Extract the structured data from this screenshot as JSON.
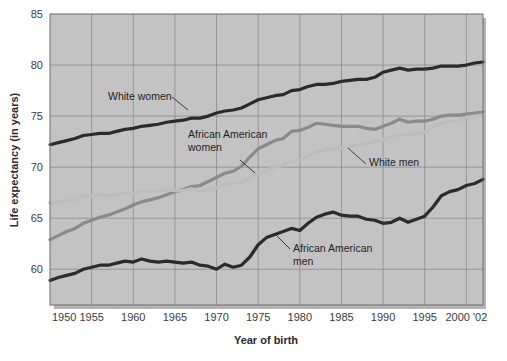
{
  "chart_data": {
    "type": "line",
    "title": "",
    "xlabel": "Year of birth",
    "ylabel": "Life expectancy (in years)",
    "xlim": [
      1950,
      2002
    ],
    "ylim": [
      56.5,
      85
    ],
    "grid": true,
    "legend_position": "inline-annotations",
    "x_ticks": [
      1950,
      1955,
      1960,
      1965,
      1970,
      1975,
      1980,
      1985,
      1990,
      1995,
      2000
    ],
    "x_tick_labels": [
      "1950",
      "1955",
      "1960",
      "1965",
      "1970",
      "1975",
      "1980",
      "1985",
      "1990",
      "1995",
      "2000 '02"
    ],
    "y_ticks": [
      60,
      65,
      70,
      75,
      80,
      85
    ],
    "y_tick_labels": [
      "60",
      "65",
      "70",
      "75",
      "80",
      "85"
    ],
    "x": [
      1950,
      1951,
      1952,
      1953,
      1954,
      1955,
      1956,
      1957,
      1958,
      1959,
      1960,
      1961,
      1962,
      1963,
      1964,
      1965,
      1966,
      1967,
      1968,
      1969,
      1970,
      1971,
      1972,
      1973,
      1974,
      1975,
      1976,
      1977,
      1978,
      1979,
      1980,
      1981,
      1982,
      1983,
      1984,
      1985,
      1986,
      1987,
      1988,
      1989,
      1990,
      1991,
      1992,
      1993,
      1994,
      1995,
      1996,
      1997,
      1998,
      1999,
      2000,
      2001,
      2002
    ],
    "series": [
      {
        "name": "White women",
        "color": "#2b2b2b",
        "width": 3.2,
        "values": [
          72.2,
          72.4,
          72.6,
          72.8,
          73.1,
          73.2,
          73.3,
          73.3,
          73.5,
          73.7,
          73.8,
          74.0,
          74.1,
          74.2,
          74.4,
          74.5,
          74.6,
          74.8,
          74.8,
          75.0,
          75.3,
          75.5,
          75.6,
          75.8,
          76.2,
          76.6,
          76.8,
          77.0,
          77.1,
          77.5,
          77.6,
          77.9,
          78.1,
          78.1,
          78.2,
          78.4,
          78.5,
          78.6,
          78.6,
          78.8,
          79.3,
          79.5,
          79.7,
          79.5,
          79.6,
          79.6,
          79.7,
          79.9,
          79.9,
          79.9,
          80.0,
          80.2,
          80.3
        ]
      },
      {
        "name": "African American women",
        "color": "#8a8a8a",
        "width": 3.2,
        "values": [
          62.9,
          63.3,
          63.7,
          64.0,
          64.5,
          64.8,
          65.1,
          65.3,
          65.6,
          65.9,
          66.3,
          66.6,
          66.8,
          67.0,
          67.3,
          67.6,
          67.8,
          68.1,
          68.2,
          68.6,
          69.0,
          69.4,
          69.6,
          70.1,
          71.0,
          71.8,
          72.2,
          72.6,
          72.8,
          73.5,
          73.6,
          73.9,
          74.3,
          74.2,
          74.1,
          74.0,
          74.0,
          74.0,
          73.8,
          73.7,
          74.0,
          74.3,
          74.7,
          74.4,
          74.5,
          74.5,
          74.7,
          75.0,
          75.1,
          75.1,
          75.2,
          75.3,
          75.4
        ]
      },
      {
        "name": "White men",
        "color": "#bdbdbd",
        "width": 3.2,
        "values": [
          66.5,
          66.6,
          66.7,
          66.8,
          67.2,
          67.2,
          67.3,
          67.2,
          67.3,
          67.5,
          67.4,
          67.7,
          67.6,
          67.6,
          67.8,
          67.7,
          67.7,
          67.9,
          67.6,
          67.8,
          68.0,
          68.3,
          68.4,
          68.5,
          69.0,
          69.4,
          69.7,
          70.0,
          70.2,
          70.6,
          70.7,
          71.1,
          71.5,
          71.7,
          71.8,
          71.9,
          72.0,
          72.2,
          72.3,
          72.5,
          72.7,
          73.0,
          73.2,
          73.1,
          73.3,
          73.4,
          73.9,
          74.3,
          74.5,
          74.6,
          74.9,
          75.0,
          75.1
        ]
      },
      {
        "name": "African American men",
        "color": "#2b2b2b",
        "width": 3.2,
        "values": [
          58.9,
          59.2,
          59.4,
          59.6,
          60.0,
          60.2,
          60.4,
          60.4,
          60.6,
          60.8,
          60.7,
          61.0,
          60.8,
          60.7,
          60.8,
          60.7,
          60.6,
          60.7,
          60.4,
          60.3,
          60.0,
          60.5,
          60.2,
          60.4,
          61.2,
          62.4,
          63.1,
          63.4,
          63.7,
          64.0,
          63.8,
          64.5,
          65.1,
          65.4,
          65.6,
          65.3,
          65.2,
          65.2,
          64.9,
          64.8,
          64.5,
          64.6,
          65.0,
          64.6,
          64.9,
          65.2,
          66.1,
          67.2,
          67.6,
          67.8,
          68.2,
          68.4,
          68.8
        ]
      }
    ],
    "annotations": [
      {
        "name": "White women",
        "text_lines": [
          "White women"
        ],
        "tx": 108,
        "ty": 100,
        "leader": "M 172,97 L 188,110"
      },
      {
        "name": "African American women",
        "text_lines": [
          "African American",
          "women"
        ],
        "tx": 188,
        "ty": 138,
        "leader": "M 240,160 L 255,173"
      },
      {
        "name": "White men",
        "text_lines": [
          "White men"
        ],
        "tx": 369,
        "ty": 166,
        "leader": "M 366,164 L 348,148"
      },
      {
        "name": "African American men",
        "text_lines": [
          "African American",
          "men"
        ],
        "tx": 293,
        "ty": 252,
        "leader": "M 290,249 L 276,235"
      }
    ]
  },
  "axes": {
    "y_axis_title": "Life expectancy (in years)",
    "x_axis_title": "Year of birth"
  },
  "colors": {
    "plot_background": "#c3c3c3",
    "gridline": "#8c8c8c",
    "page_background": "#ffffff",
    "text": "#2a2a2a"
  }
}
